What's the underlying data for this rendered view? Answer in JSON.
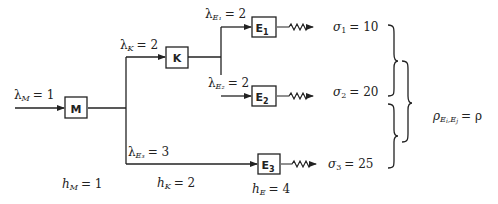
{
  "diagram": {
    "nodes": [
      {
        "id": "M",
        "label": "M",
        "sub": ""
      },
      {
        "id": "K",
        "label": "K",
        "sub": ""
      },
      {
        "id": "E1",
        "label": "E",
        "sub": "1"
      },
      {
        "id": "E2",
        "label": "E",
        "sub": "2"
      },
      {
        "id": "E3",
        "label": "E",
        "sub": "3"
      }
    ],
    "arrival_rates": {
      "M": {
        "sym": "λ",
        "sub": "M",
        "value": "= 1"
      },
      "K": {
        "sym": "λ",
        "sub": "K",
        "value": "= 2"
      },
      "E1": {
        "sym": "λ",
        "sub": "E₁",
        "value": "= 2"
      },
      "E2": {
        "sym": "λ",
        "sub": "E₂",
        "value": "= 2"
      },
      "E3": {
        "sym": "λ",
        "sub": "E₃",
        "value": "= 3"
      }
    },
    "demand_std": {
      "E1": {
        "sym": "σ",
        "sub": "1",
        "value": "= 10"
      },
      "E2": {
        "sym": "σ",
        "sub": "2",
        "value": "= 20"
      },
      "E3": {
        "sym": "σ",
        "sub": "3",
        "value": "= 25"
      }
    },
    "holding_costs": {
      "M": {
        "sym": "h",
        "sub": "M",
        "value": "= 1"
      },
      "K": {
        "sym": "h",
        "sub": "K",
        "value": "= 2"
      },
      "E": {
        "sym": "h",
        "sub": "E",
        "value": "= 4"
      }
    },
    "correlation": {
      "sym": "ρ",
      "sub": "E",
      "sub_i": "i",
      "sub_sep": ",E",
      "sub_j": "j",
      "value": "= ρ"
    }
  }
}
